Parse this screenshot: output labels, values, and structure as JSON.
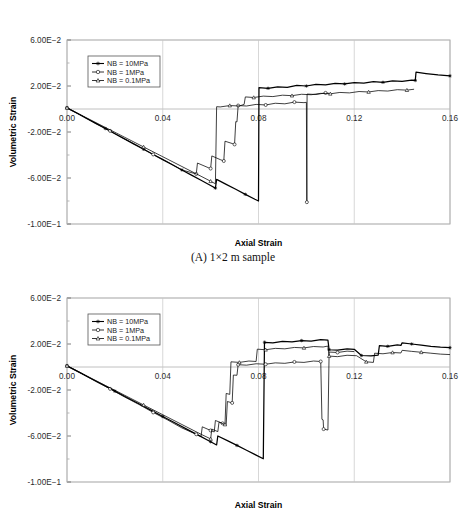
{
  "page": {
    "cropped_header_text": "",
    "caption_a": "(A) 1×2 m sample"
  },
  "axis": {
    "xlabel": "Axial Strain",
    "ylabel": "Volumetric Strain",
    "xticks": [
      "0.00",
      "0.04",
      "0.08",
      "0.12",
      "0.16"
    ],
    "yticks": [
      "6.00E-02",
      "2.00E-02",
      "-2.00E-02",
      "-6.00E-02",
      "-1.00E-01"
    ]
  },
  "legend": {
    "items": [
      {
        "label": "NB = 10MPa",
        "marker": "star-marker"
      },
      {
        "label": "NB = 1MPa",
        "marker": "open-circle-marker"
      },
      {
        "label": "NB = 0.1MPa",
        "marker": "triangle-marker"
      }
    ]
  },
  "chart_data": [
    {
      "type": "line",
      "title": "(A) 1×2 m sample",
      "xlabel": "Axial Strain",
      "ylabel": "Volumetric Strain",
      "xlim": [
        0.0,
        0.16
      ],
      "ylim": [
        -0.1,
        0.06
      ],
      "xticks": [
        0.0,
        0.04,
        0.08,
        0.12,
        0.16
      ],
      "yticks": [
        0.06,
        0.02,
        -0.02,
        -0.06,
        -0.1
      ],
      "grid": false,
      "legend_position": "upper-left",
      "series": [
        {
          "name": "NB = 10MPa",
          "marker": "star-marker",
          "points": [
            [
              0.0,
              0.001
            ],
            [
              0.004,
              -0.0035
            ],
            [
              0.008,
              -0.008
            ],
            [
              0.012,
              -0.0125
            ],
            [
              0.016,
              -0.017
            ],
            [
              0.02,
              -0.0215
            ],
            [
              0.024,
              -0.026
            ],
            [
              0.028,
              -0.0305
            ],
            [
              0.032,
              -0.035
            ],
            [
              0.036,
              -0.0395
            ],
            [
              0.04,
              -0.044
            ],
            [
              0.044,
              -0.0485
            ],
            [
              0.048,
              -0.053
            ],
            [
              0.052,
              -0.0575
            ],
            [
              0.056,
              -0.062
            ],
            [
              0.06,
              -0.0665
            ],
            [
              0.062,
              -0.0688
            ],
            [
              0.0625,
              -0.0612
            ],
            [
              0.0665,
              -0.0655
            ],
            [
              0.0705,
              -0.0698
            ],
            [
              0.0745,
              -0.0742
            ],
            [
              0.0785,
              -0.0785
            ],
            [
              0.08,
              -0.08
            ],
            [
              0.0802,
              0.0185
            ],
            [
              0.084,
              0.018
            ],
            [
              0.088,
              0.0192
            ],
            [
              0.092,
              0.0188
            ],
            [
              0.096,
              0.0205
            ],
            [
              0.1,
              0.02
            ],
            [
              0.104,
              0.0215
            ],
            [
              0.108,
              0.021
            ],
            [
              0.112,
              0.0222
            ],
            [
              0.116,
              0.0218
            ],
            [
              0.12,
              0.023
            ],
            [
              0.124,
              0.0226
            ],
            [
              0.128,
              0.0238
            ],
            [
              0.132,
              0.0232
            ],
            [
              0.136,
              0.0245
            ],
            [
              0.14,
              0.024
            ],
            [
              0.144,
              0.0252
            ],
            [
              0.1455,
              0.0248
            ],
            [
              0.1458,
              0.032
            ],
            [
              0.15,
              0.0308
            ],
            [
              0.155,
              0.0296
            ],
            [
              0.16,
              0.0288
            ]
          ]
        },
        {
          "name": "NB = 1MPa",
          "marker": "open-circle-marker",
          "points": [
            [
              0.0,
              0.001
            ],
            [
              0.006,
              -0.0055
            ],
            [
              0.012,
              -0.0125
            ],
            [
              0.018,
              -0.019
            ],
            [
              0.024,
              -0.026
            ],
            [
              0.03,
              -0.0325
            ],
            [
              0.036,
              -0.0395
            ],
            [
              0.042,
              -0.046
            ],
            [
              0.048,
              -0.053
            ],
            [
              0.054,
              -0.0565
            ],
            [
              0.0545,
              -0.047
            ],
            [
              0.059,
              -0.051
            ],
            [
              0.06,
              -0.0518
            ],
            [
              0.0605,
              -0.0408
            ],
            [
              0.064,
              -0.044
            ],
            [
              0.0655,
              -0.0452
            ],
            [
              0.066,
              -0.028
            ],
            [
              0.069,
              -0.03
            ],
            [
              0.07,
              -0.0308
            ],
            [
              0.0705,
              -0.011
            ],
            [
              0.071,
              -0.0112
            ],
            [
              0.0715,
              0.003
            ],
            [
              0.075,
              0.0026
            ],
            [
              0.079,
              0.004
            ],
            [
              0.083,
              0.0035
            ],
            [
              0.087,
              0.005
            ],
            [
              0.091,
              0.0045
            ],
            [
              0.095,
              0.006
            ],
            [
              0.099,
              0.0055
            ],
            [
              0.1,
              0.0058
            ],
            [
              0.1002,
              -0.081
            ],
            [
              0.1003,
              0.013
            ],
            [
              0.104,
              0.0126
            ],
            [
              0.108,
              0.014
            ],
            [
              0.1095,
              0.0136
            ]
          ]
        },
        {
          "name": "NB = 0.1MPa",
          "marker": "triangle-marker",
          "points": [
            [
              0.0,
              0.001
            ],
            [
              0.008,
              -0.0075
            ],
            [
              0.016,
              -0.016
            ],
            [
              0.024,
              -0.0245
            ],
            [
              0.032,
              -0.033
            ],
            [
              0.04,
              -0.0415
            ],
            [
              0.048,
              -0.05
            ],
            [
              0.056,
              -0.0585
            ],
            [
              0.06,
              -0.0628
            ],
            [
              0.062,
              -0.065
            ],
            [
              0.0625,
              0.002
            ],
            [
              0.064,
              0.0018
            ],
            [
              0.068,
              0.003
            ],
            [
              0.072,
              0.0026
            ],
            [
              0.074,
              0.004
            ],
            [
              0.0745,
              0.0105
            ],
            [
              0.078,
              0.01
            ],
            [
              0.082,
              0.0112
            ],
            [
              0.086,
              0.0108
            ],
            [
              0.09,
              0.012
            ],
            [
              0.094,
              0.0116
            ],
            [
              0.098,
              0.0128
            ],
            [
              0.102,
              0.0124
            ],
            [
              0.106,
              0.0136
            ],
            [
              0.11,
              0.0132
            ],
            [
              0.114,
              0.0144
            ],
            [
              0.118,
              0.014
            ],
            [
              0.122,
              0.0152
            ],
            [
              0.126,
              0.0148
            ],
            [
              0.13,
              0.016
            ],
            [
              0.134,
              0.0156
            ],
            [
              0.138,
              0.0168
            ],
            [
              0.142,
              0.0164
            ],
            [
              0.145,
              0.0172
            ]
          ]
        }
      ]
    },
    {
      "type": "line",
      "title": "",
      "xlabel": "Axial Strain",
      "ylabel": "Volumetric Strain",
      "xlim": [
        0.0,
        0.16
      ],
      "ylim": [
        -0.1,
        0.06
      ],
      "xticks": [
        0.0,
        0.04,
        0.08,
        0.12,
        0.16
      ],
      "yticks": [
        0.06,
        0.02,
        -0.02,
        -0.06,
        -0.1
      ],
      "grid": false,
      "legend_position": "upper-left",
      "series": [
        {
          "name": "NB = 10MPa",
          "marker": "star-marker",
          "points": [
            [
              0.0,
              0.001
            ],
            [
              0.005,
              -0.0045
            ],
            [
              0.01,
              -0.01
            ],
            [
              0.015,
              -0.0155
            ],
            [
              0.02,
              -0.021
            ],
            [
              0.025,
              -0.0265
            ],
            [
              0.03,
              -0.032
            ],
            [
              0.035,
              -0.0375
            ],
            [
              0.04,
              -0.043
            ],
            [
              0.045,
              -0.0485
            ],
            [
              0.05,
              -0.054
            ],
            [
              0.055,
              -0.0595
            ],
            [
              0.06,
              -0.065
            ],
            [
              0.0625,
              -0.0678
            ],
            [
              0.063,
              -0.06
            ],
            [
              0.067,
              -0.064
            ],
            [
              0.071,
              -0.0682
            ],
            [
              0.075,
              -0.0724
            ],
            [
              0.079,
              -0.0766
            ],
            [
              0.082,
              -0.0798
            ],
            [
              0.0825,
              0.0215
            ],
            [
              0.086,
              0.021
            ],
            [
              0.09,
              0.0222
            ],
            [
              0.094,
              0.0218
            ],
            [
              0.098,
              0.023
            ],
            [
              0.102,
              0.0226
            ],
            [
              0.106,
              0.0238
            ],
            [
              0.109,
              0.0234
            ],
            [
              0.1095,
              0.015
            ],
            [
              0.113,
              0.0146
            ],
            [
              0.117,
              0.0158
            ],
            [
              0.12,
              0.0154
            ],
            [
              0.123,
              0.01
            ],
            [
              0.127,
              0.0096
            ],
            [
              0.13,
              0.0104
            ],
            [
              0.1305,
              0.0185
            ],
            [
              0.134,
              0.018
            ],
            [
              0.138,
              0.0192
            ],
            [
              0.1395,
              0.0188
            ],
            [
              0.14,
              0.021
            ],
            [
              0.144,
              0.02
            ],
            [
              0.148,
              0.019
            ],
            [
              0.152,
              0.018
            ],
            [
              0.156,
              0.0172
            ],
            [
              0.16,
              0.0168
            ]
          ]
        },
        {
          "name": "NB = 1MPa",
          "marker": "open-circle-marker",
          "points": [
            [
              0.0,
              0.001
            ],
            [
              0.006,
              -0.0055
            ],
            [
              0.012,
              -0.0125
            ],
            [
              0.018,
              -0.019
            ],
            [
              0.024,
              -0.026
            ],
            [
              0.03,
              -0.0325
            ],
            [
              0.036,
              -0.0395
            ],
            [
              0.042,
              -0.046
            ],
            [
              0.048,
              -0.053
            ],
            [
              0.054,
              -0.0585
            ],
            [
              0.056,
              -0.0605
            ],
            [
              0.0565,
              -0.052
            ],
            [
              0.06,
              -0.0552
            ],
            [
              0.0615,
              -0.0565
            ],
            [
              0.062,
              -0.0465
            ],
            [
              0.065,
              -0.049
            ],
            [
              0.0665,
              -0.0502
            ],
            [
              0.067,
              -0.03
            ],
            [
              0.069,
              -0.0312
            ],
            [
              0.0695,
              -0.007
            ],
            [
              0.071,
              -0.0072
            ],
            [
              0.0715,
              0.002
            ],
            [
              0.075,
              0.0016
            ],
            [
              0.079,
              0.0028
            ],
            [
              0.083,
              0.0024
            ],
            [
              0.087,
              0.0036
            ],
            [
              0.091,
              0.0032
            ],
            [
              0.095,
              0.0044
            ],
            [
              0.099,
              0.004
            ],
            [
              0.103,
              0.0052
            ],
            [
              0.106,
              0.0048
            ],
            [
              0.1065,
              -0.0455
            ],
            [
              0.107,
              -0.046
            ],
            [
              0.1072,
              -0.054
            ],
            [
              0.109,
              -0.0548
            ],
            [
              0.1095,
              0.013
            ],
            [
              0.113,
              0.0126
            ],
            [
              0.117,
              0.0138
            ],
            [
              0.12,
              0.0134
            ]
          ]
        },
        {
          "name": "NB = 0.1MPa",
          "marker": "triangle-marker",
          "points": [
            [
              0.0,
              0.001
            ],
            [
              0.008,
              -0.0075
            ],
            [
              0.016,
              -0.016
            ],
            [
              0.024,
              -0.0245
            ],
            [
              0.032,
              -0.033
            ],
            [
              0.04,
              -0.0415
            ],
            [
              0.048,
              -0.05
            ],
            [
              0.056,
              -0.0585
            ],
            [
              0.06,
              -0.0625
            ],
            [
              0.0605,
              -0.054
            ],
            [
              0.063,
              -0.0562
            ],
            [
              0.0635,
              -0.048
            ],
            [
              0.066,
              -0.05
            ],
            [
              0.0665,
              -0.023
            ],
            [
              0.068,
              -0.0238
            ],
            [
              0.0685,
              0.0045
            ],
            [
              0.072,
              0.004
            ],
            [
              0.076,
              0.0052
            ],
            [
              0.079,
              0.0048
            ],
            [
              0.0795,
              0.0155
            ],
            [
              0.083,
              0.015
            ],
            [
              0.087,
              0.0162
            ],
            [
              0.091,
              0.0158
            ],
            [
              0.095,
              0.017
            ],
            [
              0.099,
              0.0166
            ],
            [
              0.103,
              0.0178
            ],
            [
              0.107,
              0.0174
            ],
            [
              0.109,
              0.0182
            ],
            [
              0.1095,
              0.0095
            ],
            [
              0.113,
              0.009
            ],
            [
              0.117,
              0.0102
            ],
            [
              0.121,
              0.0098
            ],
            [
              0.125,
              0.0045
            ],
            [
              0.128,
              0.004
            ],
            [
              0.1285,
              0.012
            ],
            [
              0.132,
              0.0115
            ],
            [
              0.136,
              0.0126
            ],
            [
              0.1395,
              0.0122
            ],
            [
              0.14,
              0.0145
            ],
            [
              0.144,
              0.0136
            ],
            [
              0.148,
              0.0128
            ],
            [
              0.152,
              0.012
            ],
            [
              0.156,
              0.0112
            ],
            [
              0.16,
              0.0108
            ]
          ]
        }
      ]
    }
  ]
}
